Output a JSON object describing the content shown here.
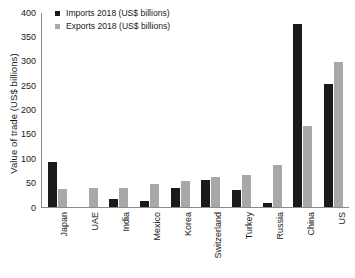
{
  "chart_data": {
    "type": "bar",
    "title": "",
    "xlabel": "",
    "ylabel": "Value of trade (US$ billions)",
    "ylim": [
      0,
      400
    ],
    "yticks": [
      400,
      350,
      300,
      250,
      200,
      150,
      100,
      50,
      0
    ],
    "grid": false,
    "legend_position": "top-left",
    "categories": [
      "Japan",
      "UAE",
      "India",
      "Mexico",
      "Korea",
      "Switzerland",
      "Turkey",
      "Russia",
      "China",
      "US"
    ],
    "series": [
      {
        "name": "Imports 2018 (US$ billions)",
        "color": "#1a1a1a",
        "values": [
          92,
          0,
          16,
          12,
          40,
          55,
          34,
          8,
          375,
          252
        ]
      },
      {
        "name": "Exports 2018 (US$ billions)",
        "color": "#a8a8a8",
        "values": [
          37,
          39,
          40,
          48,
          54,
          61,
          66,
          86,
          167,
          297
        ]
      }
    ]
  },
  "colors": {
    "imports": "#1a1a1a",
    "exports": "#a8a8a8",
    "axis": "#8a8a8a",
    "text": "#1a1a1a",
    "background": "#ffffff"
  }
}
